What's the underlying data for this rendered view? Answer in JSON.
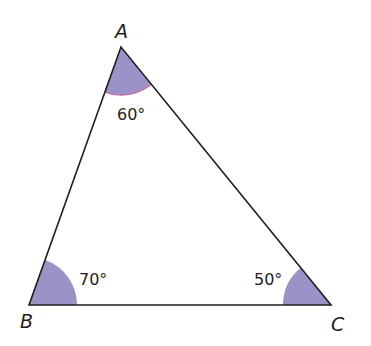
{
  "diagram": {
    "type": "triangle",
    "colors": {
      "angle_fill": "#9b93c8",
      "angle_edge": "#c86aa8",
      "stroke": "#1e1e1e",
      "background": "#ffffff"
    },
    "vertices": {
      "A": {
        "label": "A",
        "angle": "60°"
      },
      "B": {
        "label": "B",
        "angle": "70°"
      },
      "C": {
        "label": "C",
        "angle": "50°"
      }
    }
  }
}
